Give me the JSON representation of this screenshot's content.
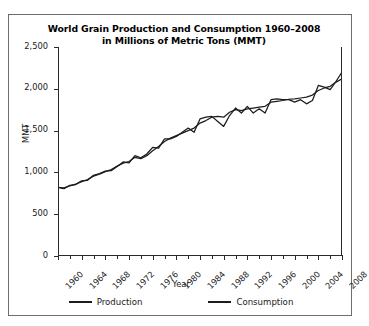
{
  "chart_data": {
    "type": "line",
    "title": "World Grain Production and Consumption 1960–2008",
    "subtitle": "in Millions of Metric Tons (MMT)",
    "title_line1": "World Grain Production and Consumption 1960–2008",
    "title_line2": "in Millions of Metric Tons (MMT)",
    "xlabel": "Year",
    "ylabel": "MMT",
    "xlim": [
      1960,
      2008
    ],
    "ylim": [
      0,
      2500
    ],
    "yticks": [
      0,
      500,
      1000,
      1500,
      2000,
      2500
    ],
    "ytick_labels": [
      "0",
      "500",
      "1,000",
      "1,500",
      "2,000",
      "2,500"
    ],
    "xticks": [
      1960,
      1964,
      1968,
      1972,
      1976,
      1980,
      1984,
      1988,
      1992,
      1996,
      2000,
      2004,
      2008
    ],
    "xtick_labels": [
      "1960",
      "1964",
      "1968",
      "1972",
      "1976",
      "1980",
      "1984",
      "1988",
      "1992",
      "1996",
      "2000",
      "2004",
      "2008"
    ],
    "xtick_minor_step": 2,
    "grid": false,
    "legend_position": "below",
    "line_color": "#1c1c1c",
    "x": [
      1960,
      1961,
      1962,
      1963,
      1964,
      1965,
      1966,
      1967,
      1968,
      1969,
      1970,
      1971,
      1972,
      1973,
      1974,
      1975,
      1976,
      1977,
      1978,
      1979,
      1980,
      1981,
      1982,
      1983,
      1984,
      1985,
      1986,
      1987,
      1988,
      1989,
      1990,
      1991,
      1992,
      1993,
      1994,
      1995,
      1996,
      1997,
      1998,
      1999,
      2000,
      2001,
      2002,
      2003,
      2004,
      2005,
      2006,
      2007,
      2008
    ],
    "series": [
      {
        "name": "Production",
        "values": [
          822,
          805,
          845,
          855,
          900,
          905,
          965,
          985,
          1015,
          1020,
          1070,
          1125,
          1115,
          1200,
          1175,
          1220,
          1300,
          1290,
          1400,
          1400,
          1430,
          1480,
          1530,
          1480,
          1640,
          1660,
          1670,
          1610,
          1550,
          1680,
          1770,
          1710,
          1790,
          1710,
          1760,
          1710,
          1870,
          1880,
          1870,
          1870,
          1840,
          1870,
          1820,
          1860,
          2040,
          2020,
          1990,
          2090,
          2200
        ],
        "color": "#1c1c1c"
      },
      {
        "name": "Consumption",
        "values": [
          820,
          815,
          840,
          860,
          890,
          915,
          955,
          980,
          1010,
          1035,
          1075,
          1110,
          1130,
          1180,
          1165,
          1200,
          1260,
          1310,
          1370,
          1410,
          1440,
          1470,
          1500,
          1530,
          1590,
          1620,
          1660,
          1670,
          1660,
          1720,
          1750,
          1740,
          1760,
          1770,
          1780,
          1790,
          1840,
          1850,
          1860,
          1875,
          1880,
          1890,
          1900,
          1925,
          1980,
          2010,
          2030,
          2080,
          2120
        ],
        "color": "#1c1c1c"
      }
    ]
  },
  "legend": {
    "items": [
      {
        "label": "Production"
      },
      {
        "label": "Consumption"
      }
    ]
  }
}
